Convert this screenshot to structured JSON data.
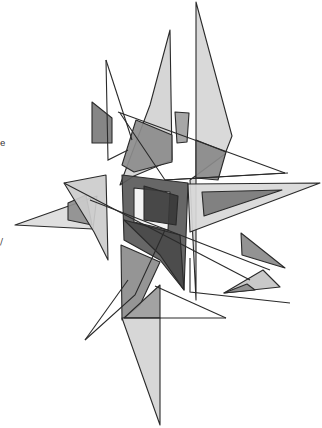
{
  "artwork": {
    "title": "Abstract geometric composition",
    "background": "#ffffff",
    "stroke": "#2a2a2a",
    "shapes": [
      {
        "name": "tall-light-spike-right",
        "fill": "#d6d6d6",
        "points": "196,2 232,136 225,154 190,180 196,300"
      },
      {
        "name": "tall-light-sail-left",
        "fill": "#d2d2d2",
        "points": "170,30 172,160 134,176 120,185 150,105"
      },
      {
        "name": "mid-dark-quad",
        "fill": "#8c8c8c",
        "points": "136,120 172,135 172,162 134,172 122,165"
      },
      {
        "name": "upper-right-dark",
        "fill": "#8a8a8a",
        "points": "196,140 226,152 218,180 196,178"
      },
      {
        "name": "small-gray-tab",
        "fill": "#a0a0a0",
        "points": "175,112 189,113 187,142 177,143"
      },
      {
        "name": "left-dark-tab",
        "fill": "#7c7c7c",
        "points": "92,102 112,118 112,143 92,143"
      },
      {
        "name": "left-light-triangle",
        "fill": "#dcdcdc",
        "points": "15,225 97,196 93,229"
      },
      {
        "name": "left-mid-triangle",
        "fill": "#8e8e8e",
        "points": "68,203 86,195 92,225 68,220"
      },
      {
        "name": "left-spike-light",
        "fill": "#cccccc",
        "points": "64,183 106,175 108,260 94,232"
      },
      {
        "name": "frame-outer",
        "fill": "#5a5a5a",
        "points": "122,175 188,183 184,290 160,260 124,240"
      },
      {
        "name": "frame-window",
        "fill": "#ffffff",
        "points": "134,188 170,192 168,230 134,222"
      },
      {
        "name": "frame-inner-dark",
        "fill": "#3a3a3a",
        "points": "144,186 178,196 176,225 144,220"
      },
      {
        "name": "frame-lower-dark",
        "fill": "#4a4a4a",
        "points": "124,220 180,235 184,290 160,255"
      },
      {
        "name": "right-big-light-triangle",
        "fill": "#d8d8d8",
        "points": "188,184 320,183 190,232"
      },
      {
        "name": "right-dark-triangle",
        "fill": "#7a7a7a",
        "points": "202,192 282,190 204,216"
      },
      {
        "name": "small-right-triangle",
        "fill": "#8a8a8a",
        "points": "241,233 285,268 242,255"
      },
      {
        "name": "lower-left-dark",
        "fill": "#8c8c8c",
        "points": "121,245 160,262 140,305 122,320"
      },
      {
        "name": "lower-center-mid",
        "fill": "#9a9a9a",
        "points": "160,285 160,318 124,318"
      },
      {
        "name": "lower-spike-light",
        "fill": "#d4d4d4",
        "points": "122,318 160,318 160,425"
      },
      {
        "name": "lower-right-triangle",
        "fill": "#c4c4c4",
        "points": "224,293 263,270 280,287"
      },
      {
        "name": "lower-right-small-dark",
        "fill": "#8c8c8c",
        "points": "224,293 247,284 255,290"
      }
    ],
    "lines": [
      {
        "name": "long-diagonal-upper",
        "points": "118,112 285,173"
      },
      {
        "name": "diagonal-to-right",
        "points": "120,113 165,180 285,173"
      },
      {
        "name": "left-thin-spike",
        "points": "106,60 108,160 128,150"
      },
      {
        "name": "left-needle",
        "points": "106,60 132,140"
      },
      {
        "name": "cross-diagonal-left",
        "points": "64,183 250,280"
      },
      {
        "name": "cross-diagonal-long",
        "points": "90,200 270,270"
      },
      {
        "name": "lower-left-needles",
        "points": "85,340 135,295 165,230"
      },
      {
        "name": "lower-left-needle-2",
        "points": "85,340 128,280"
      },
      {
        "name": "lower-open-triangle",
        "points": "190,258 190,292 290,303"
      },
      {
        "name": "lower-right-line",
        "points": "155,286 226,318"
      },
      {
        "name": "bottom-horizontal",
        "points": "124,318 226,318"
      },
      {
        "name": "right-horizontal",
        "points": "165,180 288,173"
      }
    ]
  },
  "edge_marks": [
    {
      "text": "e",
      "x": 0,
      "y": 138
    },
    {
      "text": "/",
      "x": 0,
      "y": 237
    }
  ]
}
